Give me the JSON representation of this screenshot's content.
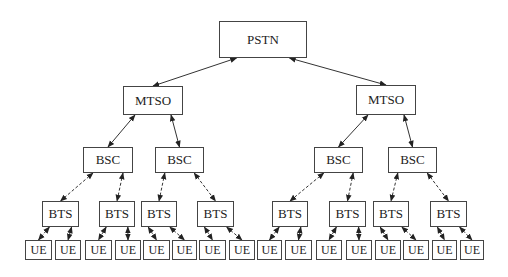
{
  "diagram": {
    "type": "hierarchical-network-tree",
    "colors": {
      "line": "#333333",
      "border": "#444444",
      "text": "#222222",
      "background": "#ffffff"
    },
    "nodes": [
      {
        "id": "pstn",
        "label": "PSTN",
        "level": 0,
        "x": 219,
        "y": 21,
        "w": 88,
        "h": 37
      },
      {
        "id": "mtso1",
        "label": "MTSO",
        "level": 1,
        "x": 123,
        "y": 86,
        "w": 60,
        "h": 29
      },
      {
        "id": "mtso2",
        "label": "MTSO",
        "level": 1,
        "x": 356,
        "y": 85,
        "w": 60,
        "h": 30
      },
      {
        "id": "bsc1",
        "label": "BSC",
        "level": 2,
        "x": 83,
        "y": 147,
        "w": 50,
        "h": 26
      },
      {
        "id": "bsc2",
        "label": "BSC",
        "level": 2,
        "x": 155,
        "y": 147,
        "w": 49,
        "h": 26
      },
      {
        "id": "bsc3",
        "label": "BSC",
        "level": 2,
        "x": 314,
        "y": 147,
        "w": 49,
        "h": 26
      },
      {
        "id": "bsc4",
        "label": "BSC",
        "level": 2,
        "x": 388,
        "y": 147,
        "w": 49,
        "h": 26
      },
      {
        "id": "bts1",
        "label": "BTS",
        "level": 3,
        "x": 42,
        "y": 201,
        "w": 37,
        "h": 26
      },
      {
        "id": "bts2",
        "label": "BTS",
        "level": 3,
        "x": 99,
        "y": 201,
        "w": 36,
        "h": 26
      },
      {
        "id": "bts3",
        "label": "BTS",
        "level": 3,
        "x": 141,
        "y": 201,
        "w": 36,
        "h": 26
      },
      {
        "id": "bts4",
        "label": "BTS",
        "level": 3,
        "x": 197,
        "y": 201,
        "w": 37,
        "h": 26
      },
      {
        "id": "bts5",
        "label": "BTS",
        "level": 3,
        "x": 272,
        "y": 201,
        "w": 36,
        "h": 26
      },
      {
        "id": "bts6",
        "label": "BTS",
        "level": 3,
        "x": 329,
        "y": 201,
        "w": 37,
        "h": 26
      },
      {
        "id": "bts7",
        "label": "BTS",
        "level": 3,
        "x": 373,
        "y": 201,
        "w": 36,
        "h": 26
      },
      {
        "id": "bts8",
        "label": "BTS",
        "level": 3,
        "x": 430,
        "y": 201,
        "w": 37,
        "h": 26
      },
      {
        "id": "ue1",
        "label": "UE",
        "level": 4,
        "x": 25,
        "y": 240,
        "w": 27,
        "h": 20
      },
      {
        "id": "ue2",
        "label": "UE",
        "level": 4,
        "x": 55,
        "y": 240,
        "w": 26,
        "h": 20
      },
      {
        "id": "ue3",
        "label": "UE",
        "level": 4,
        "x": 85,
        "y": 240,
        "w": 27,
        "h": 20
      },
      {
        "id": "ue4",
        "label": "UE",
        "level": 4,
        "x": 115,
        "y": 240,
        "w": 26,
        "h": 20
      },
      {
        "id": "ue5",
        "label": "UE",
        "level": 4,
        "x": 143,
        "y": 240,
        "w": 27,
        "h": 20
      },
      {
        "id": "ue6",
        "label": "UE",
        "level": 4,
        "x": 172,
        "y": 240,
        "w": 25,
        "h": 20
      },
      {
        "id": "ue7",
        "label": "UE",
        "level": 4,
        "x": 199,
        "y": 240,
        "w": 27,
        "h": 20
      },
      {
        "id": "ue8",
        "label": "UE",
        "level": 4,
        "x": 229,
        "y": 240,
        "w": 26,
        "h": 20
      },
      {
        "id": "ue9",
        "label": "UE",
        "level": 4,
        "x": 257,
        "y": 240,
        "w": 25,
        "h": 20
      },
      {
        "id": "ue10",
        "label": "UE",
        "level": 4,
        "x": 285,
        "y": 240,
        "w": 27,
        "h": 20
      },
      {
        "id": "ue11",
        "label": "UE",
        "level": 4,
        "x": 316,
        "y": 240,
        "w": 26,
        "h": 20
      },
      {
        "id": "ue12",
        "label": "UE",
        "level": 4,
        "x": 346,
        "y": 240,
        "w": 26,
        "h": 20
      },
      {
        "id": "ue13",
        "label": "UE",
        "level": 4,
        "x": 375,
        "y": 240,
        "w": 26,
        "h": 20
      },
      {
        "id": "ue14",
        "label": "UE",
        "level": 4,
        "x": 403,
        "y": 240,
        "w": 26,
        "h": 20
      },
      {
        "id": "ue15",
        "label": "UE",
        "level": 4,
        "x": 432,
        "y": 240,
        "w": 25,
        "h": 20
      },
      {
        "id": "ue16",
        "label": "UE",
        "level": 4,
        "x": 460,
        "y": 240,
        "w": 24,
        "h": 20
      }
    ],
    "edges": [
      {
        "from": "pstn",
        "to": "mtso1",
        "style": "solid",
        "bidirectional": true
      },
      {
        "from": "pstn",
        "to": "mtso2",
        "style": "solid",
        "bidirectional": true
      },
      {
        "from": "mtso1",
        "to": "bsc1",
        "style": "solid",
        "bidirectional": true
      },
      {
        "from": "mtso1",
        "to": "bsc2",
        "style": "solid",
        "bidirectional": true
      },
      {
        "from": "mtso2",
        "to": "bsc3",
        "style": "solid",
        "bidirectional": true
      },
      {
        "from": "mtso2",
        "to": "bsc4",
        "style": "solid",
        "bidirectional": true
      },
      {
        "from": "bsc1",
        "to": "bts1",
        "style": "dashed",
        "bidirectional": true
      },
      {
        "from": "bsc1",
        "to": "bts2",
        "style": "dashed",
        "bidirectional": true
      },
      {
        "from": "bsc2",
        "to": "bts3",
        "style": "dashed",
        "bidirectional": true
      },
      {
        "from": "bsc2",
        "to": "bts4",
        "style": "dashed",
        "bidirectional": true
      },
      {
        "from": "bsc3",
        "to": "bts5",
        "style": "dashed",
        "bidirectional": true
      },
      {
        "from": "bsc3",
        "to": "bts6",
        "style": "dashed",
        "bidirectional": true
      },
      {
        "from": "bsc4",
        "to": "bts7",
        "style": "dashed",
        "bidirectional": true
      },
      {
        "from": "bsc4",
        "to": "bts8",
        "style": "dashed",
        "bidirectional": true
      },
      {
        "from": "bts1",
        "to": "ue1",
        "style": "dashed",
        "bidirectional": true
      },
      {
        "from": "bts1",
        "to": "ue2",
        "style": "dashed",
        "bidirectional": true
      },
      {
        "from": "bts2",
        "to": "ue3",
        "style": "dashed",
        "bidirectional": true
      },
      {
        "from": "bts2",
        "to": "ue4",
        "style": "dashed",
        "bidirectional": true
      },
      {
        "from": "bts3",
        "to": "ue5",
        "style": "dashed",
        "bidirectional": true
      },
      {
        "from": "bts3",
        "to": "ue6",
        "style": "dashed",
        "bidirectional": true
      },
      {
        "from": "bts4",
        "to": "ue7",
        "style": "dashed",
        "bidirectional": true
      },
      {
        "from": "bts4",
        "to": "ue8",
        "style": "dashed",
        "bidirectional": true
      },
      {
        "from": "bts5",
        "to": "ue9",
        "style": "dashed",
        "bidirectional": true
      },
      {
        "from": "bts5",
        "to": "ue10",
        "style": "dashed",
        "bidirectional": true
      },
      {
        "from": "bts6",
        "to": "ue11",
        "style": "dashed",
        "bidirectional": true
      },
      {
        "from": "bts6",
        "to": "ue12",
        "style": "dashed",
        "bidirectional": true
      },
      {
        "from": "bts7",
        "to": "ue13",
        "style": "dashed",
        "bidirectional": true
      },
      {
        "from": "bts7",
        "to": "ue14",
        "style": "dashed",
        "bidirectional": true
      },
      {
        "from": "bts8",
        "to": "ue15",
        "style": "dashed",
        "bidirectional": true
      },
      {
        "from": "bts8",
        "to": "ue16",
        "style": "dashed",
        "bidirectional": true
      }
    ]
  }
}
